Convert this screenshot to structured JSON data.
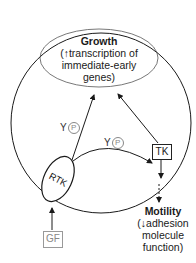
{
  "diagram": {
    "growth": {
      "title": "Growth",
      "line1": "(↑transcription of",
      "line2": "immediate-early",
      "line3": "genes)"
    },
    "motility": {
      "title": "Motility",
      "line1": "(↓adhesion",
      "line2": "molecule",
      "line3": "function)"
    },
    "nodes": {
      "rtk": "RTK",
      "tk": "TK",
      "gf": "GF"
    },
    "labels": {
      "y1": "Y",
      "p1": "P",
      "y2": "Y",
      "p2": "P"
    },
    "colors": {
      "line": "#1a1a1a",
      "gf": "#999999"
    }
  }
}
